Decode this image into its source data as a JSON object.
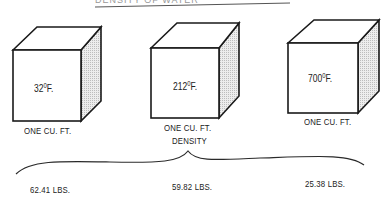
{
  "heading": {
    "text": "DENSITY OF WATER"
  },
  "cubes": [
    {
      "temp_value": "32",
      "temp_degree": "0",
      "temp_unit": "F.",
      "volume_label": "ONE CU. FT.",
      "density": "62.41 LBS."
    },
    {
      "temp_value": "212",
      "temp_degree": "0",
      "temp_unit": "F.",
      "volume_label": "ONE CU. FT.",
      "density": "59.82 LBS."
    },
    {
      "temp_value": "700",
      "temp_degree": "0",
      "temp_unit": "F.",
      "volume_label": "ONE CU. FT.",
      "density": "25.38 LBS."
    }
  ],
  "brace_label": "DENSITY",
  "colors": {
    "line": "#1a1a1a",
    "side_shade": "#d9d9d9"
  }
}
